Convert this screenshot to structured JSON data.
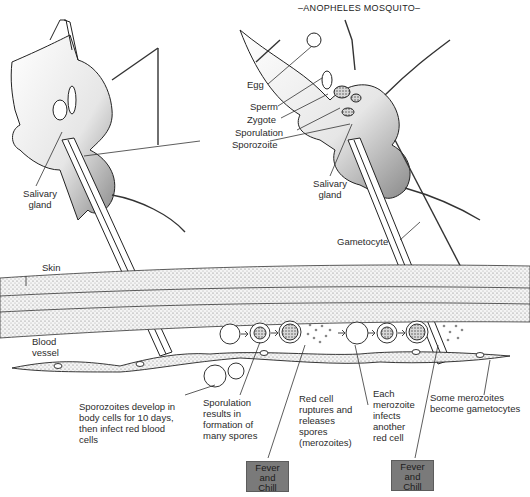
{
  "diagram": {
    "title": "–ANOPHELES MOSQUITO–",
    "topic": "Malaria life cycle",
    "mosquito_labels": {
      "egg": "Egg",
      "sperm": "Sperm",
      "zygote": "Zygote",
      "sporulation": "Sporulation",
      "sporozoite": "Sporozoite",
      "salivary_gland_left": "Salivary gland",
      "salivary_gland_right": "Salivary gland",
      "gametocyte": "Gametocyte"
    },
    "tissue_labels": {
      "skin": "Skin",
      "blood_vessel": "Blood vessel"
    },
    "stage_captions": [
      "Sporozoites develop in body cells for 10 days, then infect red blood cells",
      "Sporulation results in formation of many spores",
      "Red cell ruptures and releases spores (merozoites)",
      "Each merozoite infects another red cell",
      "Some merozoites become gametocytes"
    ],
    "symptom_boxes": [
      {
        "line1": "Fever",
        "line2": "and",
        "line3": "Chill"
      },
      {
        "line1": "Fever",
        "line2": "and",
        "line3": "Chill"
      }
    ],
    "colors": {
      "ink": "#222222",
      "stipple": "#9a9a9a",
      "symptom_box": "#7a7a7a",
      "background": "#ffffff"
    }
  }
}
